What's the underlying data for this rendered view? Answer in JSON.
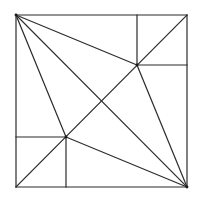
{
  "diagram": {
    "type": "geometric-construction",
    "stroke_color": "#2b2b2b",
    "background": "#ffffff",
    "points": {
      "TL": [
        16,
        15
      ],
      "TR": [
        187,
        15
      ],
      "BR": [
        187,
        187
      ],
      "BL": [
        16,
        187
      ],
      "P1": [
        137,
        65
      ],
      "P2": [
        66,
        137
      ],
      "C": [
        101,
        101
      ]
    },
    "segments": [
      {
        "id": "square-top",
        "from": "TL",
        "to": "TR"
      },
      {
        "id": "square-right",
        "from": "TR",
        "to": "BR"
      },
      {
        "id": "square-bottom",
        "from": "BR",
        "to": "BL"
      },
      {
        "id": "square-left",
        "from": "BL",
        "to": "TL"
      },
      {
        "id": "diagonal-main",
        "from": "TL",
        "to": "BR"
      },
      {
        "id": "diagonal-anti",
        "from": "BL",
        "to": "TR"
      },
      {
        "id": "tl-to-p1",
        "from": "TL",
        "to": "P1"
      },
      {
        "id": "p1-to-br",
        "from": "P1",
        "to": "BR"
      },
      {
        "id": "tl-to-p2",
        "from": "TL",
        "to": "P2"
      },
      {
        "id": "p2-to-br",
        "from": "P2",
        "to": "BR"
      },
      {
        "id": "p1-vertical-up",
        "from": "P1",
        "to": [
          137,
          15
        ]
      },
      {
        "id": "p1-horizontal-right",
        "from": "P1",
        "to": [
          187,
          65
        ]
      },
      {
        "id": "p2-horizontal-left",
        "from": "P2",
        "to": [
          16,
          137
        ]
      },
      {
        "id": "p2-vertical-down",
        "from": "P2",
        "to": [
          66,
          187
        ]
      }
    ],
    "vertex_dots": [
      "TL",
      "BR",
      "P1",
      "P2"
    ]
  }
}
